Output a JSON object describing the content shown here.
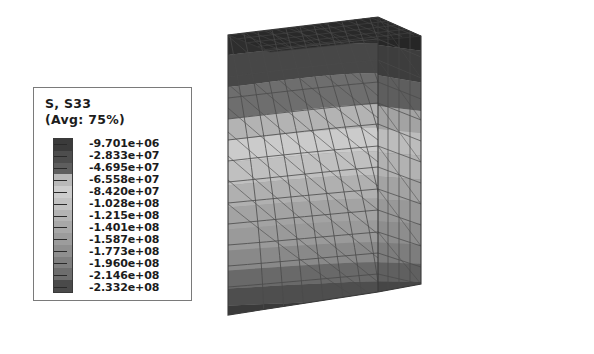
{
  "legend": {
    "title": "S, S33",
    "average": "(Avg: 75%)",
    "levels": [
      "-9.701e+06",
      "-2.833e+07",
      "-4.695e+07",
      "-6.558e+07",
      "-8.420e+07",
      "-1.028e+08",
      "-1.215e+08",
      "-1.401e+08",
      "-1.587e+08",
      "-1.773e+08",
      "-1.960e+08",
      "-2.146e+08",
      "-2.332e+08"
    ],
    "swatch_colors": [
      "#3b3b3b",
      "#4d4d4d",
      "#5e5e5e",
      "#b9b9b9",
      "#cdcdcd",
      "#c2c2c2",
      "#b4b4b4",
      "#a8a8a8",
      "#9c9c9c",
      "#8f8f8f",
      "#7f7f7f",
      "#6d6d6d",
      "#4a4a4a"
    ],
    "border_color": "#7a7a7a"
  },
  "chart_data": {
    "type": "heatmap",
    "title": "S, S33",
    "subtitle": "(Avg: 75%)",
    "units": "Pa",
    "contour_levels": [
      -9701000,
      -28330000,
      -46950000,
      -65580000,
      -84200000,
      -102800000,
      -121500000,
      -140100000,
      -158700000,
      -177300000,
      -196000000,
      -214600000,
      -233200000
    ],
    "level_labels": [
      "-9.701e+06",
      "-2.833e+07",
      "-4.695e+07",
      "-6.558e+07",
      "-8.420e+07",
      "-1.028e+08",
      "-1.215e+08",
      "-1.401e+08",
      "-1.587e+08",
      "-1.773e+08",
      "-1.960e+08",
      "-2.146e+08",
      "-2.332e+08"
    ],
    "colormap": "grayscale",
    "min": -233200000,
    "max": -9701000,
    "legend_position": "left",
    "grid": false,
    "xlabel": "",
    "ylabel": ""
  },
  "model": {
    "name": "stress-contour-cube",
    "mesh_line_color": "#4a4a4a",
    "bands": [
      {
        "name": "band-top-darkest",
        "color": "#2f2f2f"
      },
      {
        "name": "band-top-dark",
        "color": "#484848"
      },
      {
        "name": "band-upper-mid",
        "color": "#6e6e6e"
      },
      {
        "name": "band-light-a",
        "color": "#b4b4b4"
      },
      {
        "name": "band-light-b",
        "color": "#cbcbcb"
      },
      {
        "name": "band-light-c",
        "color": "#c0c0c0"
      },
      {
        "name": "band-mid-a",
        "color": "#b0b0b0"
      },
      {
        "name": "band-mid-b",
        "color": "#a4a4a4"
      },
      {
        "name": "band-mid-c",
        "color": "#9a9a9a"
      },
      {
        "name": "band-lower-a",
        "color": "#8a8a8a"
      },
      {
        "name": "band-lower-b",
        "color": "#6a6a6a"
      },
      {
        "name": "band-bottom-dark",
        "color": "#4e4e4e"
      },
      {
        "name": "band-bottom-darkest",
        "color": "#3a3a3a"
      }
    ],
    "top_face_color": "#2b2b2b",
    "right_face_color": "#8e8e8e"
  }
}
